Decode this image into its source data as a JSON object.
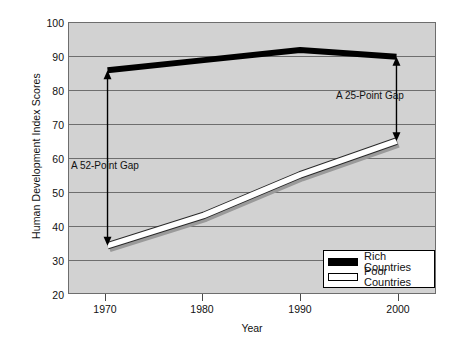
{
  "chart_data": {
    "type": "line",
    "title": "",
    "xlabel": "Year",
    "ylabel": "Human Development Index Scores",
    "x": [
      1970,
      1980,
      1990,
      2000
    ],
    "xticks": [
      "1970",
      "1980",
      "1990",
      "2000"
    ],
    "yticks": [
      "20",
      "30",
      "40",
      "50",
      "60",
      "70",
      "80",
      "90",
      "100"
    ],
    "ylim": [
      20,
      100
    ],
    "xlim": [
      1966,
      2004
    ],
    "grid": "horizontal",
    "legend_position": "bottom-right",
    "series": [
      {
        "name": "Rich Countries",
        "color": "#000000",
        "values": [
          86,
          89,
          92,
          90
        ]
      },
      {
        "name": "Poor Countries",
        "color": "#ffffff",
        "values": [
          34,
          43,
          55,
          65
        ]
      }
    ],
    "annotations": [
      {
        "label": "A  52-Point Gap",
        "at_year": 1970,
        "from": 34,
        "to": 86
      },
      {
        "label": "A 25-Point Gap",
        "at_year": 2000,
        "from": 65,
        "to": 90
      }
    ]
  },
  "legend": {
    "items": [
      {
        "label": "Rich Countries"
      },
      {
        "label": "Poor Countries"
      }
    ]
  },
  "axes": {
    "ylabel": "Human Development Index Scores",
    "xlabel": "Year",
    "yticks": [
      "100",
      "90",
      "80",
      "70",
      "60",
      "50",
      "40",
      "30",
      "20"
    ],
    "xticks": [
      "1970",
      "1980",
      "1990",
      "2000"
    ]
  },
  "annotations": {
    "left": "A  52-Point Gap",
    "right": "A 25-Point Gap"
  }
}
